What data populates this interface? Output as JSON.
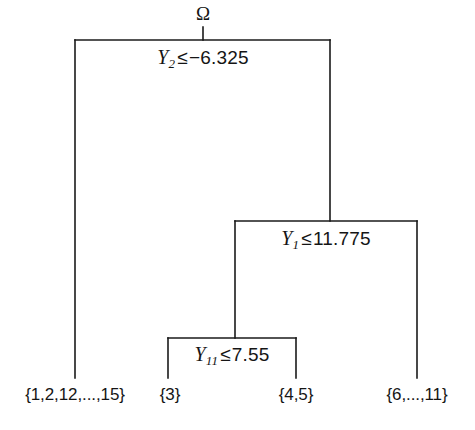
{
  "diagram": {
    "type": "binary-decision-tree",
    "title_symbol": "Ω",
    "root": {
      "name": "root-node",
      "label_var": "Y",
      "label_sub": "2",
      "label_rel": "≤",
      "label_value": "−6.325",
      "label_full": "Y2 ≤ −6.325"
    },
    "split_2": {
      "name": "split-node-2",
      "label_var": "Y",
      "label_sub": "1",
      "label_rel": "≤",
      "label_value": "11.775",
      "label_full": "Y1 ≤ 11.775"
    },
    "split_3": {
      "name": "split-node-3",
      "label_var": "Y",
      "label_sub": "11",
      "label_rel": "≤",
      "label_value": "7.55",
      "label_full": "Y11 ≤ 7.55"
    },
    "leaves": [
      {
        "name": "leaf-1",
        "label": "{1,2,12,...,15}"
      },
      {
        "name": "leaf-2",
        "label": "{3}"
      },
      {
        "name": "leaf-3",
        "label": "{4,5}"
      },
      {
        "name": "leaf-4",
        "label": "{6,...,11}"
      }
    ],
    "colors": {
      "stroke": "#1a1a1a",
      "text": "#151515",
      "background": "#ffffff"
    }
  }
}
